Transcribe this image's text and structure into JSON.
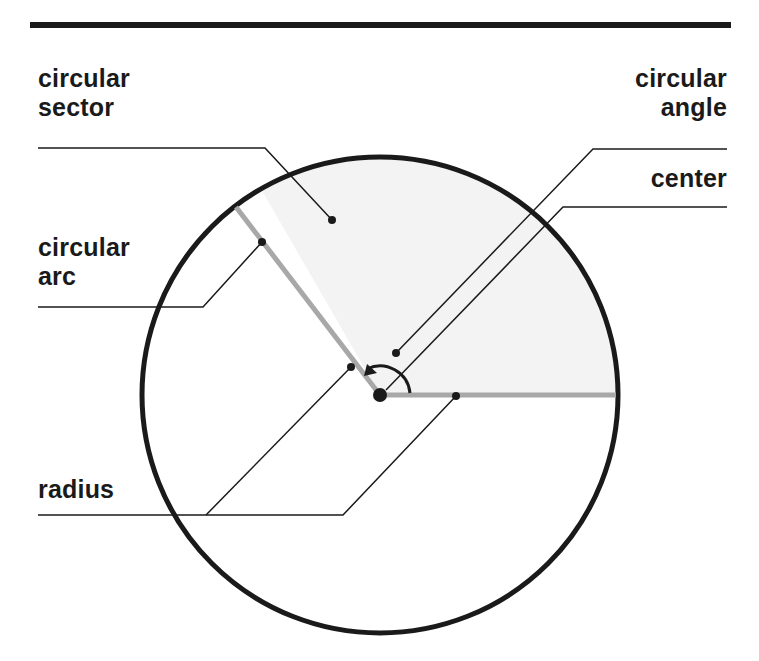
{
  "diagram": {
    "title_rule_color": "#1a1a1a",
    "labels": {
      "circular_sector": [
        "circular",
        "sector"
      ],
      "circular_angle": [
        "circular",
        "angle"
      ],
      "center": "center",
      "circular_arc": [
        "circular",
        "arc"
      ],
      "radius": "radius"
    },
    "colors": {
      "circle_stroke": "#1a1a1a",
      "sector_fill": "#f3f3f3",
      "radius_stroke": "#a8a8a8",
      "leader_stroke": "#1a1a1a"
    },
    "geometry": {
      "center": [
        380,
        395
      ],
      "radius": 238,
      "sector_start_deg": 0,
      "sector_end_deg": 120
    }
  }
}
